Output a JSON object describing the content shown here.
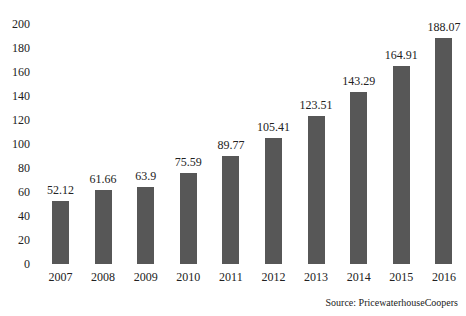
{
  "chart_data": {
    "type": "bar",
    "title": "",
    "xlabel": "",
    "ylabel": "",
    "categories": [
      "2007",
      "2008",
      "2009",
      "2010",
      "2011",
      "2012",
      "2013",
      "2014",
      "2015",
      "2016"
    ],
    "values": [
      52.12,
      61.66,
      63.9,
      75.59,
      89.77,
      105.41,
      123.51,
      143.29,
      164.91,
      188.07
    ],
    "value_labels": [
      "52.12",
      "61.66",
      "63.9",
      "75.59",
      "89.77",
      "105.41",
      "123.51",
      "143.29",
      "164.91",
      "188.07"
    ],
    "yticks": [
      "0",
      "20",
      "40",
      "60",
      "80",
      "100",
      "120",
      "140",
      "160",
      "180",
      "200"
    ],
    "ylim": [
      0,
      200
    ],
    "grid": false,
    "legend": null,
    "bar_color": "#575757",
    "annotation": "Source: PricewaterhouseCoopers"
  }
}
